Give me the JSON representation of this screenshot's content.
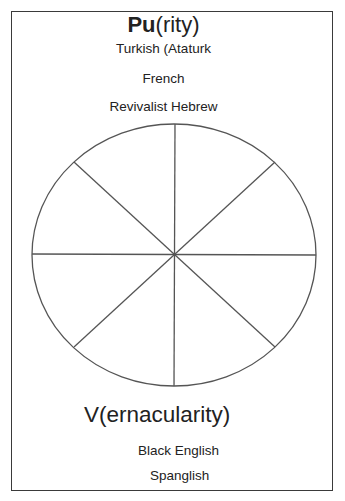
{
  "diagram": {
    "type": "circle-divided-into-8-sectors",
    "top_label": {
      "bold_part": "Pu",
      "regular_part": "(rity)"
    },
    "top_examples": [
      "Turkish (Ataturk",
      "French",
      "Revivalist Hebrew"
    ],
    "bottom_label": "V(ernacularity)",
    "bottom_examples": [
      "Black English",
      "Spanglish"
    ],
    "stroke_color": "#555555",
    "border_color": "#3a3a3a"
  }
}
